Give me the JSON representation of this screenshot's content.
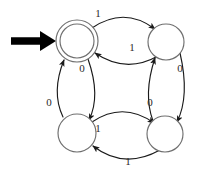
{
  "diagram": {
    "type": "state-transition-diagram",
    "colors": {
      "background": "#ffffff",
      "node_stroke": "#6f6f6f",
      "edge_stroke": "#1a1a1a",
      "start_arrow": "#000000",
      "label_text": "#2a2a2a"
    },
    "states": [
      {
        "id": "q-top-left",
        "label": "",
        "cx": 77,
        "cy": 41,
        "r": 21,
        "accepting": true,
        "start": true
      },
      {
        "id": "q-top-right",
        "label": "",
        "cx": 166,
        "cy": 42,
        "r": 18,
        "accepting": false,
        "start": false
      },
      {
        "id": "q-bottom-left",
        "label": "",
        "cx": 77,
        "cy": 133,
        "r": 19,
        "accepting": false,
        "start": false
      },
      {
        "id": "q-bottom-right",
        "label": "",
        "cx": 165,
        "cy": 134,
        "r": 18,
        "accepting": false,
        "start": false
      }
    ],
    "start_marker": {
      "name": "start-arrow",
      "from_x": 10,
      "to_x": 54,
      "y": 41
    },
    "transitions": [
      {
        "id": "tl-to-tr",
        "from": "q-top-left",
        "to": "q-top-right",
        "symbol": "1",
        "label_x": 98,
        "label_y": 17
      },
      {
        "id": "tr-to-tl",
        "from": "q-top-right",
        "to": "q-top-left",
        "symbol": "1",
        "label_x": 132,
        "label_y": 51
      },
      {
        "id": "tl-to-bl",
        "from": "q-top-left",
        "to": "q-bottom-left",
        "symbol": "0",
        "label_x": 82,
        "label_y": 72
      },
      {
        "id": "bl-to-tl",
        "from": "q-bottom-left",
        "to": "q-top-left",
        "symbol": "0",
        "label_x": 49,
        "label_y": 106
      },
      {
        "id": "tr-to-br",
        "from": "q-top-right",
        "to": "q-bottom-right",
        "symbol": "0",
        "label_x": 180,
        "label_y": 72
      },
      {
        "id": "br-to-tr",
        "from": "q-bottom-right",
        "to": "q-top-right",
        "symbol": "0",
        "label_x": 150,
        "label_y": 106
      },
      {
        "id": "bl-to-br",
        "from": "q-bottom-left",
        "to": "q-bottom-right",
        "symbol": "1",
        "label_x": 98,
        "label_y": 132
      },
      {
        "id": "br-to-bl",
        "from": "q-bottom-right",
        "to": "q-bottom-left",
        "symbol": "1",
        "label_x": 128,
        "label_y": 165
      }
    ]
  }
}
